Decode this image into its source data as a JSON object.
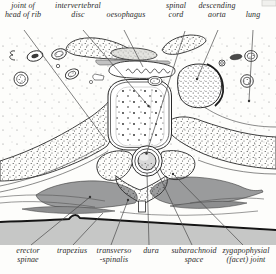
{
  "figure_type": "anatomical cross-section diagram (thoracic vertebra level)",
  "labels": {
    "top": [
      {
        "name": "joint-of-head-of-rib",
        "lines": [
          "joint of",
          "head of rib"
        ]
      },
      {
        "name": "intervertebral-disc",
        "lines": [
          "intervertebral",
          "disc"
        ]
      },
      {
        "name": "oesophagus",
        "lines": [
          "oesophagus"
        ]
      },
      {
        "name": "spinal-cord",
        "lines": [
          "spinal",
          "cord"
        ]
      },
      {
        "name": "descending-aorta",
        "lines": [
          "descending",
          "aorta"
        ]
      },
      {
        "name": "lung",
        "lines": [
          "lung"
        ]
      }
    ],
    "bottom": [
      {
        "name": "erector-spinae",
        "lines": [
          "erector",
          "spinae"
        ]
      },
      {
        "name": "trapezius",
        "lines": [
          "trapezius"
        ]
      },
      {
        "name": "transverso-spinalis",
        "lines": [
          "transverso",
          "-spinalis"
        ]
      },
      {
        "name": "dura",
        "lines": [
          "dura"
        ]
      },
      {
        "name": "subarachnoid-space",
        "lines": [
          "subarachnoid",
          "space"
        ]
      },
      {
        "name": "zygapophysial-facet-joint",
        "lines": [
          "zygapophysial",
          "(facet) joint"
        ]
      }
    ]
  },
  "colors": {
    "background": "#fdfdfb",
    "line": "#2a2a2a",
    "muscle_gray": "#9a9b9c",
    "deep_muscle_gray": "#8d8e8f",
    "trapezius_band_gray": "#c6c7c6",
    "cord_fill": "#d8d8d8",
    "label_text": "#2c2c2c"
  }
}
